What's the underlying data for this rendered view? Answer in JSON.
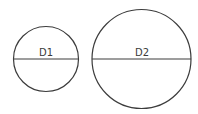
{
  "diagram": {
    "stroke_color": "#3c3c3c",
    "background": "#ffffff",
    "circles": [
      {
        "label": "D1",
        "cx": 46,
        "cy": 59,
        "r": 32.5
      },
      {
        "label": "D2",
        "cx": 141.5,
        "cy": 59,
        "r": 49.5
      }
    ]
  }
}
